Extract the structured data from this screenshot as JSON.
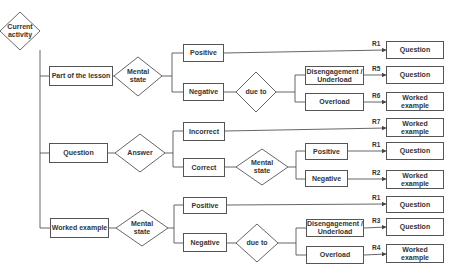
{
  "diagram": {
    "root": "Current activity",
    "branches": [
      {
        "activity": "Part of the lesson",
        "decision": "Mental state",
        "outcomes": [
          {
            "label": "Positive",
            "rule": "R1",
            "result": "Question"
          },
          {
            "label": "Negative",
            "decision": "due to",
            "causes": [
              {
                "label": "Disengagement / Underload",
                "rule": "R5",
                "result": "Question"
              },
              {
                "label": "Overload",
                "rule": "R6",
                "result": "Worked example"
              }
            ]
          }
        ]
      },
      {
        "activity": "Question",
        "decision": "Answer",
        "outcomes": [
          {
            "label": "Incorrect",
            "rule": "R7",
            "result": "Worked example"
          },
          {
            "label": "Correct",
            "decision": "Mental state",
            "states": [
              {
                "label": "Positive",
                "rule": "R1",
                "result": "Question"
              },
              {
                "label": "Negative",
                "rule": "R2",
                "result": "Worked example"
              }
            ]
          }
        ]
      },
      {
        "activity": "Worked example",
        "decision": "Mental state",
        "outcomes": [
          {
            "label": "Positive",
            "rule": "R1",
            "result": "Question"
          },
          {
            "label": "Negative",
            "decision": "due to",
            "causes": [
              {
                "label": "Disengagement / Underload",
                "rule": "R3",
                "result": "Question"
              },
              {
                "label": "Overload",
                "rule": "R4",
                "result": "Worked example"
              }
            ]
          }
        ]
      }
    ]
  }
}
